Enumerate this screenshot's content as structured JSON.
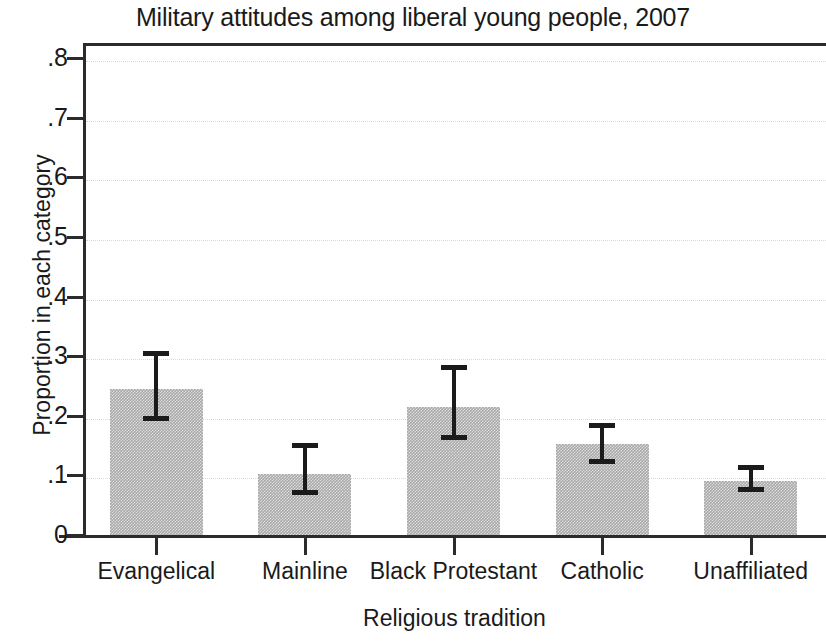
{
  "chart_data": {
    "type": "bar",
    "title": "Military attitudes among liberal young people, 2007",
    "xlabel": "Religious tradition",
    "ylabel": "Proportion in each category",
    "categories": [
      "Evangelical",
      "Mainline",
      "Black Protestant",
      "Catholic",
      "Unaffiliated"
    ],
    "values": [
      0.245,
      0.103,
      0.215,
      0.152,
      0.091
    ],
    "error_low": [
      0.192,
      0.067,
      0.159,
      0.119,
      0.072
    ],
    "error_high": [
      0.309,
      0.155,
      0.285,
      0.188,
      0.118
    ],
    "ylim": [
      0,
      0.8
    ],
    "yticks": [
      0,
      0.1,
      0.2,
      0.3,
      0.4,
      0.5,
      0.6,
      0.7,
      0.8
    ],
    "ytick_labels": [
      "0",
      ".1",
      ".2",
      ".3",
      ".4",
      ".5",
      ".6",
      ".7",
      ".8"
    ],
    "grid": true,
    "legend": "none",
    "bar_color": "#a9a9a9",
    "error_color": "#1b1b1b",
    "axis_color": "#2b2b2b"
  }
}
